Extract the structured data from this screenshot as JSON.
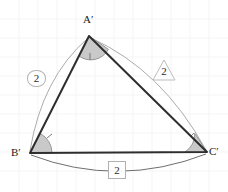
{
  "figure": {
    "type": "geometry-diagram",
    "background_color": "#ffffff",
    "grid": {
      "visible": true,
      "color": "#f4f4f6",
      "spacing_px": 19
    },
    "triangle": {
      "stroke_color": "#2e2e2e",
      "stroke_width": 2,
      "fill": "none",
      "vertices": [
        {
          "name": "A-prime",
          "label": "A′",
          "x": 89,
          "y": 36,
          "label_x": 83,
          "label_y": 14
        },
        {
          "name": "B-prime",
          "label": "B′",
          "x": 30,
          "y": 153,
          "label_x": 12,
          "label_y": 147
        },
        {
          "name": "C-prime",
          "label": "C′",
          "x": 207,
          "y": 152,
          "label_x": 209,
          "label_y": 147
        }
      ]
    },
    "angle_arcs": [
      {
        "name": "angle-a-prime",
        "vertex": "A-prime",
        "fill": "#c9c9c9",
        "stroke": "#8a8a8a",
        "radius": 20,
        "ticks": 1
      },
      {
        "name": "angle-b-prime",
        "vertex": "B-prime",
        "fill": "#c9c9c9",
        "stroke": "#8a8a8a",
        "radius": 22,
        "ticks": 1
      },
      {
        "name": "angle-c-prime",
        "vertex": "C-prime",
        "fill": "#c9c9c9",
        "stroke": "#8a8a8a",
        "radius": 22,
        "ticks": 1
      }
    ],
    "measure_arcs": [
      {
        "name": "arc-side-ab",
        "from": "A-prime",
        "to": "B-prime",
        "stroke": "#a9a9a9",
        "bows": "outward-left"
      },
      {
        "name": "arc-side-ac",
        "from": "A-prime",
        "to": "C-prime",
        "stroke": "#a9a9a9",
        "bows": "outward-right"
      },
      {
        "name": "arc-side-bc",
        "from": "B-prime",
        "to": "C-prime",
        "stroke": "#6e6e6e",
        "bows": "outward-down"
      }
    ],
    "side_labels": [
      {
        "name": "side-label-ab",
        "value": "2",
        "side": "A'B'",
        "box": "rounded",
        "x": 27,
        "y": 70
      },
      {
        "name": "side-label-ac",
        "value": "2",
        "side": "A'C'",
        "box": "diamond",
        "x": 154,
        "y": 62
      },
      {
        "name": "side-label-bc",
        "value": "2",
        "side": "B'C'",
        "box": "square",
        "x": 108,
        "y": 161
      }
    ]
  }
}
